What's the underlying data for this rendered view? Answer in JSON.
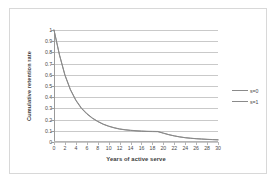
{
  "chart_data": {
    "type": "line",
    "title": "",
    "xlabel": "Years of active serve",
    "ylabel": "Cumulative retention rate",
    "xlim": [
      0,
      30
    ],
    "ylim": [
      0,
      1
    ],
    "grid": true,
    "grid_axis": "y",
    "legend_position": "right",
    "x_tick_labels": [
      "0",
      "2",
      "4",
      "6",
      "8",
      "10",
      "12",
      "14",
      "16",
      "18",
      "20",
      "22",
      "24",
      "26",
      "28",
      "30"
    ],
    "x_tick_values": [
      0,
      2,
      4,
      6,
      8,
      10,
      12,
      14,
      16,
      18,
      20,
      22,
      24,
      26,
      28,
      30
    ],
    "y_tick_labels": [
      "0",
      "0.1",
      "0.2",
      "0.3",
      "0.4",
      "0.5",
      "0.6",
      "0.7",
      "0.8",
      "0.9",
      "1"
    ],
    "y_tick_values": [
      0,
      0.1,
      0.2,
      0.3,
      0.4,
      0.5,
      0.6,
      0.7,
      0.8,
      0.9,
      1
    ],
    "x": [
      0,
      1,
      2,
      3,
      4,
      5,
      6,
      7,
      8,
      9,
      10,
      11,
      12,
      13,
      14,
      15,
      16,
      17,
      18,
      19,
      20,
      21,
      22,
      23,
      24,
      25,
      26,
      27,
      28,
      29,
      30
    ],
    "series": [
      {
        "name": "s=0",
        "color": "#8a8a8a",
        "values": [
          1.0,
          0.78,
          0.6,
          0.47,
          0.375,
          0.305,
          0.255,
          0.215,
          0.185,
          0.16,
          0.142,
          0.128,
          0.117,
          0.11,
          0.105,
          0.101,
          0.098,
          0.096,
          0.095,
          0.094,
          0.08,
          0.066,
          0.055,
          0.046,
          0.039,
          0.034,
          0.03,
          0.027,
          0.024,
          0.022,
          0.02
        ]
      },
      {
        "name": "s=1",
        "color": "#8a8a8a",
        "values": [
          1.0,
          0.775,
          0.595,
          0.465,
          0.37,
          0.3,
          0.25,
          0.212,
          0.182,
          0.158,
          0.14,
          0.126,
          0.115,
          0.108,
          0.103,
          0.099,
          0.096,
          0.094,
          0.093,
          0.092,
          0.078,
          0.065,
          0.054,
          0.045,
          0.038,
          0.033,
          0.029,
          0.026,
          0.023,
          0.021,
          0.019
        ]
      }
    ],
    "legend_entries": [
      "s=0",
      "s=1"
    ]
  }
}
